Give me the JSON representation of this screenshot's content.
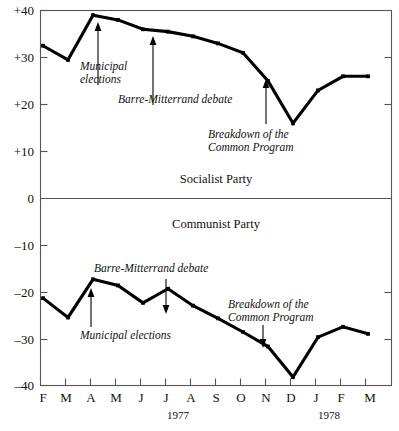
{
  "chart_data": {
    "type": "line",
    "title": "",
    "xlabel": "",
    "ylabel": "",
    "ylim": [
      -40,
      40
    ],
    "grid": false,
    "legend_position": "inline-labels",
    "x_tick_labels": [
      "F",
      "M",
      "A",
      "M",
      "J",
      "J",
      "A",
      "S",
      "O",
      "N",
      "D",
      "J",
      "F",
      "M"
    ],
    "y_tick_labels": [
      "+40",
      "+30",
      "+20",
      "+10",
      "0",
      "–10",
      "–20",
      "–30",
      "–40"
    ],
    "y_tick_values": [
      40,
      30,
      20,
      10,
      0,
      -10,
      -20,
      -30,
      -40
    ],
    "year_labels": [
      {
        "text": "1977",
        "at_tick": "J"
      },
      {
        "text": "1978",
        "at_tick": "J"
      }
    ],
    "series": [
      {
        "name": "Socialist Party",
        "label_text": "Socialist Party",
        "x": [
          "F",
          "M",
          "A",
          "M",
          "J",
          "J",
          "A",
          "S",
          "O",
          "N",
          "D",
          "J",
          "F",
          "M"
        ],
        "values": [
          32.5,
          29.5,
          39.0,
          38.0,
          36.0,
          35.5,
          34.5,
          33.0,
          31.0,
          25.0,
          16.0,
          23.0,
          26.0,
          26.0
        ]
      },
      {
        "name": "Communist Party",
        "label_text": "Communist Party",
        "x": [
          "F",
          "M",
          "A",
          "M",
          "J",
          "J",
          "A",
          "S",
          "O",
          "N",
          "D",
          "J",
          "F",
          "M"
        ],
        "values": [
          -21.2,
          -25.3,
          -17.2,
          -18.5,
          -22.2,
          -19.2,
          -22.8,
          -25.5,
          -28.4,
          -31.5,
          -38.0,
          -29.5,
          -27.3,
          -28.8
        ]
      }
    ],
    "annotations": [
      {
        "id": "socialist-municipal",
        "text_lines": [
          "Municipal",
          "elections"
        ],
        "panel": "Socialist Party",
        "points_to": "A 1977"
      },
      {
        "id": "socialist-barre",
        "text_lines": [
          "Barre-Mitterrand debate"
        ],
        "panel": "Socialist Party",
        "points_to": "J 1977"
      },
      {
        "id": "socialist-breakdown",
        "text_lines": [
          "Breakdown of the",
          "Common Program"
        ],
        "panel": "Socialist Party",
        "points_to": "O 1977"
      },
      {
        "id": "communist-barre",
        "text_lines": [
          "Barre-Mitterrand debate"
        ],
        "panel": "Communist Party",
        "points_to": "J 1977"
      },
      {
        "id": "communist-municipal",
        "text_lines": [
          "Municipal elections"
        ],
        "panel": "Communist Party",
        "points_to": "A 1977"
      },
      {
        "id": "communist-breakdown",
        "text_lines": [
          "Breakdown of the",
          "Common Program"
        ],
        "panel": "Communist Party",
        "points_to": "O 1977"
      }
    ],
    "colors": {
      "line": "#000000",
      "axis": "#555555",
      "text": "#111111",
      "background": "#ffffff"
    }
  }
}
